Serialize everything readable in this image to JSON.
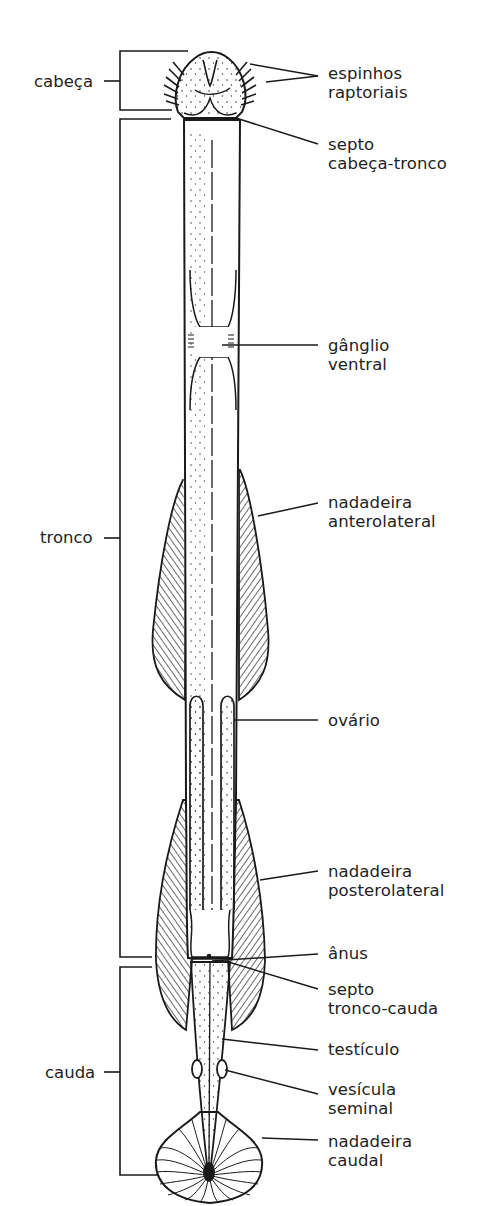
{
  "figure": {
    "regions": [
      {
        "id": "head",
        "label": "cabeça"
      },
      {
        "id": "trunk",
        "label": "tronco"
      },
      {
        "id": "tail",
        "label": "cauda"
      }
    ],
    "structures": [
      {
        "id": "spines",
        "lines": [
          "espinhos",
          "raptoriais"
        ]
      },
      {
        "id": "head-trunk-septum",
        "lines": [
          "septo",
          "cabeça-tronco"
        ]
      },
      {
        "id": "ventral-ganglion",
        "lines": [
          "gânglio",
          "ventral"
        ]
      },
      {
        "id": "anterior-fin",
        "lines": [
          "nadadeira",
          "anterolateral"
        ]
      },
      {
        "id": "ovary",
        "lines": [
          "ovário"
        ]
      },
      {
        "id": "posterior-fin",
        "lines": [
          "nadadeira",
          "posterolateral"
        ]
      },
      {
        "id": "anus",
        "lines": [
          "ânus"
        ]
      },
      {
        "id": "trunk-tail-septum",
        "lines": [
          "septo",
          "tronco-cauda"
        ]
      },
      {
        "id": "testis",
        "lines": [
          "testículo"
        ]
      },
      {
        "id": "seminal-vesicle",
        "lines": [
          "vesícula",
          "seminal"
        ]
      },
      {
        "id": "caudal-fin",
        "lines": [
          "nadadeira",
          "caudal"
        ]
      }
    ],
    "colors": {
      "ink": "#1a1a1a",
      "background": "#ffffff"
    }
  }
}
